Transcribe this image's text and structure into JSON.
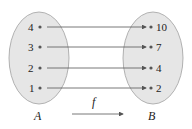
{
  "diagram": {
    "type": "function-mapping",
    "sets": {
      "domain": {
        "label": "A",
        "elements": [
          "4",
          "3",
          "2",
          "1"
        ]
      },
      "codomain": {
        "label": "B",
        "elements": [
          "10",
          "7",
          "4",
          "2"
        ]
      }
    },
    "mappings": [
      {
        "from": "4",
        "to": "10"
      },
      {
        "from": "3",
        "to": "7"
      },
      {
        "from": "2",
        "to": "4"
      },
      {
        "from": "1",
        "to": "2"
      }
    ],
    "function_label": "f",
    "colors": {
      "set_fill": "#e6e6e6",
      "set_stroke": "#9a9a9a",
      "arrow": "#555555",
      "text": "#222222"
    }
  }
}
